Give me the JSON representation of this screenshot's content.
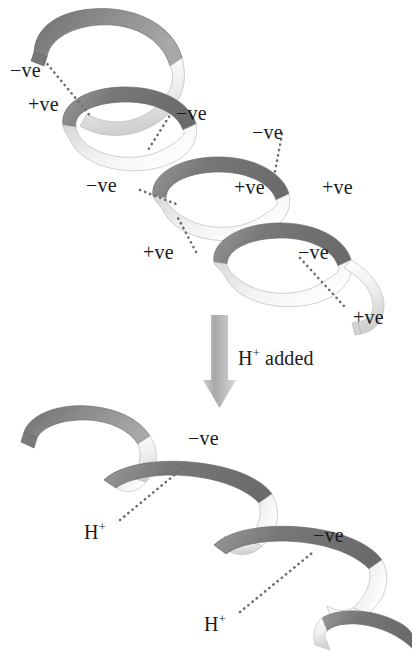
{
  "figure": {
    "background_color": "#ffffff",
    "text_color": "#1a1a1a",
    "ribbon_dark_color": "#737373",
    "ribbon_light_color": "#ebebeb",
    "ribbon_mid_color": "#b5b5b5",
    "dotted_line_color": "#6e6e6e",
    "arrow_color": "#b3b3b3"
  },
  "top_structure": {
    "name": "alpha-helix",
    "charge_labels": [
      {
        "id": "t1",
        "text": "−ve",
        "x": 10,
        "y": 60
      },
      {
        "id": "t2",
        "text": "+ve",
        "x": 28,
        "y": 94
      },
      {
        "id": "t3",
        "text": "−ve",
        "x": 176,
        "y": 103
      },
      {
        "id": "t4",
        "text": "−ve",
        "x": 252,
        "y": 122
      },
      {
        "id": "t5",
        "text": "−ve",
        "x": 86,
        "y": 175
      },
      {
        "id": "t6",
        "text": "+ve",
        "x": 234,
        "y": 177
      },
      {
        "id": "t7",
        "text": "+ve",
        "x": 322,
        "y": 177
      },
      {
        "id": "t8",
        "text": "+ve",
        "x": 143,
        "y": 242
      },
      {
        "id": "t9",
        "text": "−ve",
        "x": 298,
        "y": 242
      },
      {
        "id": "t10",
        "text": "+ve",
        "x": 353,
        "y": 307
      }
    ]
  },
  "transition": {
    "arrow": {
      "name": "down-arrow",
      "direction": "down"
    },
    "caption": {
      "text_main": "H",
      "text_sup": "+",
      "text_rest": " added",
      "x": 238,
      "y": 348
    }
  },
  "bottom_structure": {
    "name": "random-coil",
    "charge_labels": [
      {
        "id": "b1",
        "text": "−ve",
        "x": 188,
        "y": 428
      },
      {
        "id": "b2",
        "text": "−ve",
        "x": 313,
        "y": 525
      }
    ],
    "proton_labels": [
      {
        "id": "h1",
        "text_main": "H",
        "text_sup": "+",
        "x": 84,
        "y": 522
      },
      {
        "id": "h2",
        "text_main": "H",
        "text_sup": "+",
        "x": 204,
        "y": 614
      }
    ]
  }
}
